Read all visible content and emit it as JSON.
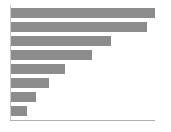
{
  "chart_data": {
    "type": "bar",
    "orientation": "horizontal",
    "title": "",
    "subtitle": "",
    "xlabel": "",
    "ylabel": "",
    "grid": false,
    "legend": null,
    "legend_position": "none",
    "bar_color": "#8c8c8c",
    "background_color": "#ffffff",
    "axis_color": "#b0b0b0",
    "categories": [
      "1",
      "2",
      "3",
      "4",
      "5",
      "6",
      "7",
      "8"
    ],
    "tick_labels": [],
    "xlim": [
      0,
      100
    ],
    "values": [
      100,
      94,
      69,
      56,
      37,
      26,
      17,
      11
    ],
    "bars": [
      {
        "name": "bar-1",
        "value": 100,
        "pixel_length": 144,
        "pixel_top": 8,
        "pixel_height": 10
      },
      {
        "name": "bar-2",
        "value": 94,
        "pixel_length": 136,
        "pixel_top": 22,
        "pixel_height": 10
      },
      {
        "name": "bar-3",
        "value": 69,
        "pixel_length": 100,
        "pixel_top": 36,
        "pixel_height": 10
      },
      {
        "name": "bar-4",
        "value": 56,
        "pixel_length": 81,
        "pixel_top": 50,
        "pixel_height": 10
      },
      {
        "name": "bar-5",
        "value": 37,
        "pixel_length": 54,
        "pixel_top": 64,
        "pixel_height": 10
      },
      {
        "name": "bar-6",
        "value": 26,
        "pixel_length": 38,
        "pixel_top": 78,
        "pixel_height": 10
      },
      {
        "name": "bar-7",
        "value": 17,
        "pixel_length": 25,
        "pixel_top": 92,
        "pixel_height": 10
      },
      {
        "name": "bar-8",
        "value": 11,
        "pixel_length": 16,
        "pixel_top": 106,
        "pixel_height": 10
      }
    ]
  }
}
